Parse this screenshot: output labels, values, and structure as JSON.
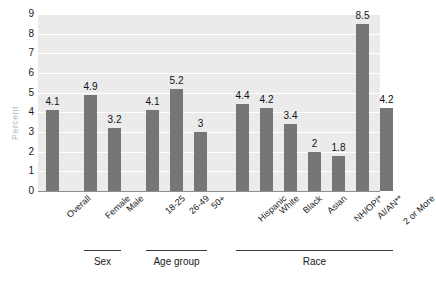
{
  "chart_data": {
    "type": "bar",
    "title": "",
    "xlabel": "",
    "ylabel": "Percent",
    "ylim": [
      0,
      9
    ],
    "grid": true,
    "legend": "none",
    "yticks": [
      "9",
      "8",
      "7",
      "6",
      "5",
      "4",
      "3",
      "2",
      "1",
      "0"
    ],
    "categories": [
      "Overall",
      "Female",
      "Male",
      "18-25",
      "26-49",
      "50+",
      "Hispanic",
      "White",
      "Black",
      "Asian",
      "NH/OPI*",
      "AI/AN**",
      "2 or More"
    ],
    "values": [
      4.1,
      4.9,
      3.2,
      4.1,
      5.2,
      3,
      4.4,
      4.2,
      3.4,
      2,
      1.8,
      8.5,
      4.2
    ],
    "value_labels": [
      "4.1",
      "4.9",
      "3.2",
      "4.1",
      "5.2",
      "3",
      "4.4",
      "4.2",
      "3.4",
      "2",
      "1.8",
      "8.5",
      "4.2"
    ],
    "groups": [
      {
        "label": "Sex",
        "members": [
          "Female",
          "Male"
        ]
      },
      {
        "label": "Age group",
        "members": [
          "18-25",
          "26-49",
          "50+"
        ]
      },
      {
        "label": "Race",
        "members": [
          "Hispanic",
          "White",
          "Black",
          "Asian",
          "NH/OPI*",
          "AI/AN**",
          "2 or More"
        ]
      }
    ],
    "colors": {
      "bar": "#767676",
      "plot_background": "#ebebeb",
      "gridline": "#ffffff",
      "axis_title": "#b9b9b9",
      "text": "#1a1a1a"
    }
  }
}
